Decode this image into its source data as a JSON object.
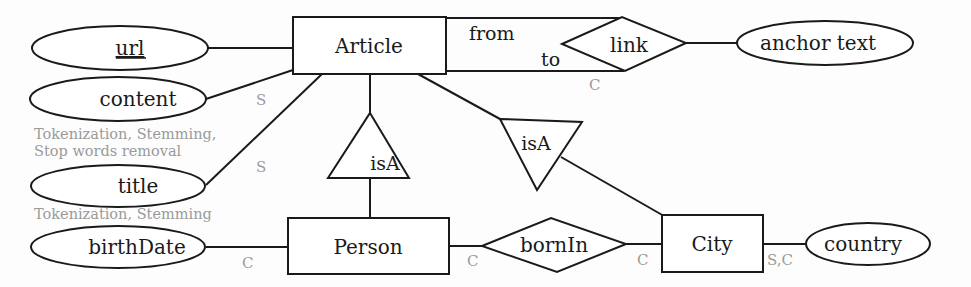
{
  "diagram": {
    "type": "entity-relationship",
    "entities": [
      {
        "id": "article",
        "label": "Article"
      },
      {
        "id": "person",
        "label": "Person"
      },
      {
        "id": "city",
        "label": "City"
      }
    ],
    "relationships": [
      {
        "id": "link",
        "label": "link",
        "roles": {
          "from": "from",
          "to": "to"
        }
      },
      {
        "id": "bornin",
        "label": "bornIn"
      }
    ],
    "isa": [
      {
        "id": "isa-person",
        "label": "isA"
      },
      {
        "id": "isa-city",
        "label": "isA"
      }
    ],
    "attributes": [
      {
        "id": "url",
        "label": "url",
        "key": true
      },
      {
        "id": "content",
        "label": "content"
      },
      {
        "id": "title",
        "label": "title"
      },
      {
        "id": "birthdate",
        "label": "birthDate"
      },
      {
        "id": "anchor",
        "label": "anchor text"
      },
      {
        "id": "country",
        "label": "country"
      }
    ],
    "annotations": {
      "content_edge": "S",
      "title_edge": "S",
      "link_edge": "C",
      "birthdate_edge": "C",
      "person_bornin": "C",
      "city_bornin": "C",
      "city_country": "S,C",
      "content_note_1": "Tokenization, Stemming,",
      "content_note_2": "Stop words removal",
      "title_note": "Tokenization, Stemming"
    }
  }
}
